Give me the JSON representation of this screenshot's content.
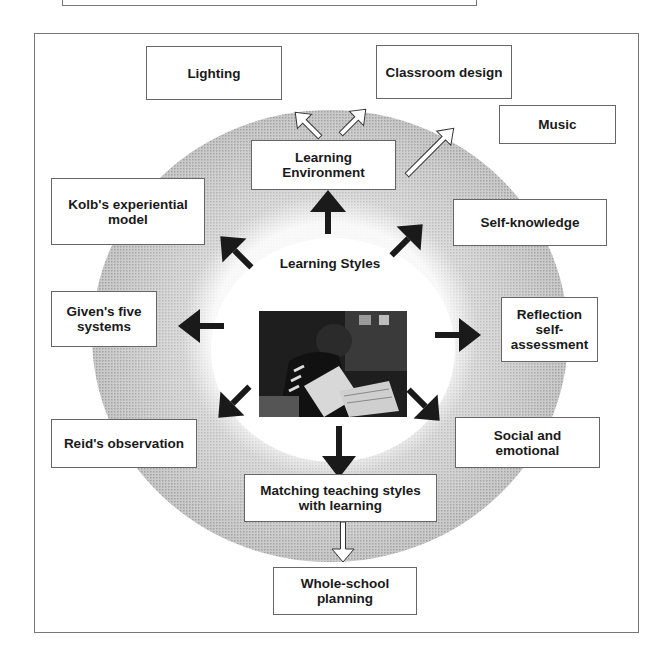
{
  "diagram": {
    "center": {
      "title": "Learning Styles",
      "image_alt": "Photo of a student reading a newspaper"
    },
    "nodes": {
      "learning_environment": "Learning Environment",
      "lighting": "Lighting",
      "classroom_design": "Classroom design",
      "music": "Music",
      "kolb": "Kolb's experiential model",
      "self_knowledge": "Self-knowledge",
      "given": "Given's five systems",
      "reflection": "Reflection self-assessment",
      "reid": "Reid's observation",
      "social": "Social and emotional",
      "matching": "Matching teaching styles with learning",
      "whole_school": "Whole-school planning"
    },
    "edges": [
      {
        "from": "Learning Styles",
        "to": "Learning Environment",
        "style": "solid-black"
      },
      {
        "from": "Learning Styles",
        "to": "Kolb's experiential model",
        "style": "solid-black"
      },
      {
        "from": "Learning Styles",
        "to": "Self-knowledge",
        "style": "solid-black"
      },
      {
        "from": "Learning Styles",
        "to": "Given's five systems",
        "style": "solid-black"
      },
      {
        "from": "Learning Styles",
        "to": "Reflection self-assessment",
        "style": "solid-black"
      },
      {
        "from": "Learning Styles",
        "to": "Reid's observation",
        "style": "solid-black"
      },
      {
        "from": "Learning Styles",
        "to": "Social and emotional",
        "style": "solid-black"
      },
      {
        "from": "Learning Styles",
        "to": "Matching teaching styles with learning",
        "style": "solid-black"
      },
      {
        "from": "Learning Environment",
        "to": "Lighting",
        "style": "outline-white"
      },
      {
        "from": "Learning Environment",
        "to": "Classroom design",
        "style": "outline-white"
      },
      {
        "from": "Learning Environment",
        "to": "Music",
        "style": "outline-white"
      },
      {
        "from": "Matching teaching styles with learning",
        "to": "Whole-school planning",
        "style": "outline-white"
      }
    ],
    "colors": {
      "ring": "#b5b5b5",
      "arrow_solid": "#1a1a1a",
      "border": "#666666"
    }
  }
}
